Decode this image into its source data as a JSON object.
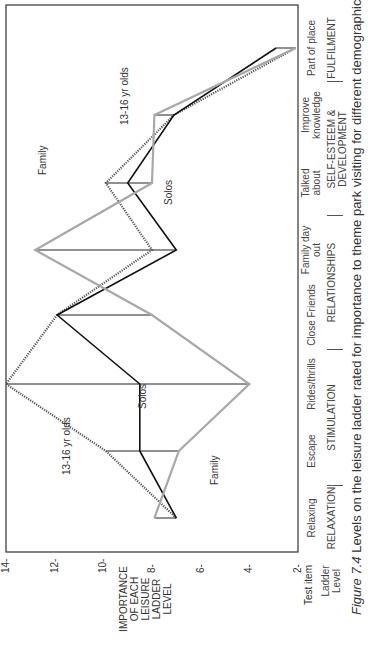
{
  "figure": {
    "caption_prefix": "Figure 7.4",
    "caption_text": " Levels on the leisure ladder rated for importance to theme park visiting for different demographic segments"
  },
  "axis": {
    "y_label_lines": [
      "IMPORTANCE",
      "OF EACH",
      "LEISURE",
      "LADDER",
      "LEVEL"
    ],
    "y_ticks": [
      "14",
      "12",
      "10",
      "8",
      "6",
      "4",
      "2"
    ],
    "test_item_label": "Test item",
    "ladder_level_label": [
      "Ladder",
      "Level"
    ]
  },
  "chart_data": {
    "type": "line",
    "title": "Levels on the leisure ladder rated for importance to theme park visiting for different demographic segments",
    "xlabel": "Test item / Ladder Level",
    "ylabel": "IMPORTANCE OF EACH LEISURE LADDER LEVEL",
    "ylim": [
      2,
      14
    ],
    "y_ticks": [
      14,
      12,
      10,
      8,
      6,
      4,
      2
    ],
    "grid": false,
    "orientation_note": "Figure printed rotated 90 degrees counter-clockwise",
    "categories": [
      "Relaxing",
      "Escape",
      "Rides/thrills",
      "Close Friends",
      "Family day out",
      "Talked about",
      "Improve knowledge",
      "Part of place"
    ],
    "ladder_levels": [
      {
        "name": "RELAXATION",
        "items": [
          "Relaxing"
        ]
      },
      {
        "name": "STIMULATION",
        "items": [
          "Escape",
          "Rides/thrills"
        ]
      },
      {
        "name": "RELATIONSHIPS",
        "items": [
          "Close Friends",
          "Family day out"
        ]
      },
      {
        "name": "SELF-ESTEEM & DEVELOPMENT",
        "items": [
          "Talked about",
          "Improve knowledge"
        ]
      },
      {
        "name": "FULFILMENT",
        "items": [
          "Part of place"
        ]
      }
    ],
    "series": [
      {
        "name": "13-16 yr olds",
        "style": "dark dotted",
        "values": [
          7.0,
          9.9,
          14.0,
          11.9,
          8.0,
          9.9,
          7.1,
          2.1
        ]
      },
      {
        "name": "Solos",
        "style": "black solid",
        "values": [
          7.0,
          8.5,
          8.5,
          11.9,
          7.0,
          9.0,
          7.1,
          2.9
        ]
      },
      {
        "name": "Family",
        "style": "light grey",
        "values": [
          7.9,
          6.9,
          4.0,
          8.0,
          12.8,
          8.0,
          7.9,
          2.1
        ]
      }
    ],
    "annotations": [
      {
        "text": "13-16 yr olds",
        "near": "Escape"
      },
      {
        "text": "Solos",
        "near": "Rides/thrills"
      },
      {
        "text": "Family",
        "near": "Escape"
      },
      {
        "text": "Family",
        "near": "Talked about"
      },
      {
        "text": "Solos",
        "near": "Talked about"
      },
      {
        "text": "13-16 yr olds",
        "near": "Improve knowledge"
      }
    ]
  },
  "colors": {
    "teen": "#555555",
    "solos": "#111111",
    "family": "#a8a8a8",
    "frame": "#333333"
  }
}
